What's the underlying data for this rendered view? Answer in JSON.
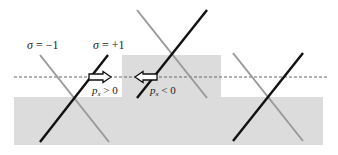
{
  "diagram": {
    "colors": {
      "background": "#ffffff",
      "region_fill": "#dcdcdc",
      "black_line": "#111111",
      "gray_line": "#9a9a9a",
      "dashed_line": "#666666",
      "arrow_fill": "#ffffff",
      "arrow_stroke": "#111111"
    },
    "labels": {
      "sigma_minus": {
        "symbol": "σ",
        "text": " = −1"
      },
      "sigma_plus": {
        "symbol": "σ",
        "text": " = +1"
      },
      "px_positive": {
        "p": "p",
        "sub": "x",
        "rel": " > 0"
      },
      "px_negative": {
        "p": "p",
        "sub": "x",
        "rel": " < 0"
      }
    },
    "regions": {
      "lower_band": {
        "x": 14,
        "y": 97,
        "w": 309,
        "h": 48
      },
      "raised_block": {
        "x": 122,
        "y": 55,
        "w": 99,
        "h": 42
      }
    },
    "fermi_level": {
      "x1": 14,
      "x2": 328,
      "y": 77
    },
    "crossings": [
      {
        "name": "left",
        "black": [
          108,
          55,
          40,
          142
        ],
        "gray": [
          40,
          55,
          109,
          142
        ]
      },
      {
        "name": "middle",
        "black": [
          207,
          10,
          137,
          98
        ],
        "gray": [
          137,
          10,
          207,
          98
        ]
      },
      {
        "name": "right",
        "black": [
          303,
          53,
          233,
          141
        ],
        "gray": [
          233,
          53,
          303,
          141
        ]
      }
    ],
    "arrows": [
      {
        "name": "right-arrow",
        "direction": "right",
        "x_start": 89,
        "x_end": 111,
        "y": 77
      },
      {
        "name": "left-arrow",
        "direction": "left",
        "x_start": 157,
        "x_end": 135,
        "y": 77
      }
    ]
  }
}
